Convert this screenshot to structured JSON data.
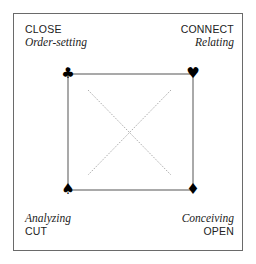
{
  "corners": {
    "top_left": {
      "title": "CLOSE",
      "subtitle": "Order-setting",
      "suit": "♣",
      "suit_name": "club"
    },
    "top_right": {
      "title": "CONNECT",
      "subtitle": "Relating",
      "suit": "♥",
      "suit_name": "heart"
    },
    "bottom_left": {
      "title": "CUT",
      "subtitle": "Analyzing",
      "suit": "♠",
      "suit_name": "spade"
    },
    "bottom_right": {
      "title": "OPEN",
      "subtitle": "Conceiving",
      "suit": "♦",
      "suit_name": "diamond"
    }
  },
  "colors": {
    "frame": "#6a6a6a",
    "square": "#555555",
    "diagonals": "#888888",
    "text": "#222222"
  }
}
